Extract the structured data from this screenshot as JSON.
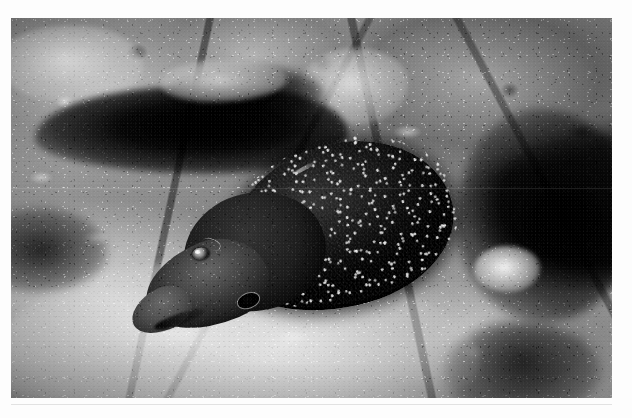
{
  "page": {
    "background_color": "#fdfdfd",
    "width": 632,
    "height": 418
  },
  "photograph": {
    "kind": "photograph",
    "medium": "black-and-white underwater photograph",
    "frame": {
      "x": 11,
      "y": 18,
      "width": 601,
      "height": 380
    },
    "alt_text": "Black and white underwater photograph of a large moray eel emerging head-first from a crevice in a rocky coral reef.",
    "palette": {
      "paper": "#fdfdfd",
      "rule": "#e2e2e2",
      "highlight_coral": "#f2efe8",
      "mid_rock": "#9b978f",
      "deep_shadow": "#0a0a09",
      "eel_body": "#1a1918",
      "eel_head": "#5a5854",
      "speckle": "#f7f6f2"
    },
    "subject": {
      "name": "moray-eel",
      "common_name": "Giant moray eel",
      "pose": "head pointing down and to the lower-left, body receding up and to the right into the reef",
      "markings": "dark body densely covered with small white speckles",
      "features": [
        {
          "name": "eye",
          "note": "pale ringed eye on the left side of the head"
        },
        {
          "name": "gill-pore",
          "note": "dark circular gill opening with a light rim, behind and below the eye"
        },
        {
          "name": "snout",
          "note": "blunt pale-grey snout at the lower-left"
        },
        {
          "name": "mouth",
          "note": "dark jaw line along the underside of the snout"
        }
      ]
    },
    "background_elements": [
      {
        "name": "coral-boulder-upper-left",
        "tone": "bright"
      },
      {
        "name": "coral-head-upper-middle",
        "tone": "bright"
      },
      {
        "name": "shadow-crevice-upper",
        "tone": "very dark"
      },
      {
        "name": "pale-sand-patch-upper",
        "tone": "light grey"
      },
      {
        "name": "dark-water-right",
        "tone": "very dark"
      },
      {
        "name": "coral-knob-right",
        "tone": "bright highlight"
      },
      {
        "name": "rubble-field-lower",
        "tone": "bright, highly textured"
      },
      {
        "name": "shadow-wedge-lower-left",
        "tone": "dark"
      }
    ]
  }
}
